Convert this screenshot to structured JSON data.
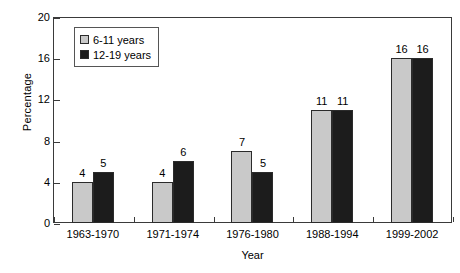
{
  "chart_data": {
    "type": "bar",
    "title": "",
    "xlabel": "Year",
    "ylabel": "Percentage",
    "categories": [
      "1963-1970",
      "1971-1974",
      "1976-1980",
      "1988-1994",
      "1999-2002"
    ],
    "series": [
      {
        "name": "6-11 years",
        "values": [
          4,
          4,
          7,
          11,
          16
        ],
        "color": "#c9c9c9"
      },
      {
        "name": "12-19 years",
        "values": [
          5,
          6,
          5,
          11,
          16
        ],
        "color": "#1c1c1c"
      }
    ],
    "ylim": [
      0,
      20
    ],
    "yticks": [
      0,
      4,
      8,
      12,
      16,
      20
    ],
    "ytick_labels": [
      "0",
      "4",
      "8",
      "12",
      "16",
      "20"
    ],
    "grid": false,
    "legend_position": "top-left",
    "data_labels": true,
    "axis_color": "#3a3a3a"
  }
}
